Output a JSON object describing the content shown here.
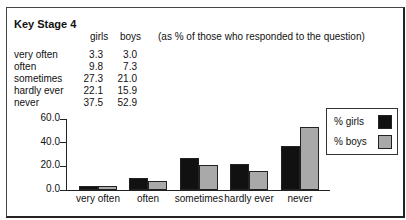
{
  "table": {
    "title": "Key Stage 4",
    "columns": [
      "girls",
      "boys"
    ],
    "note": "(as % of those who responded to the question)",
    "rows": [
      {
        "label": "very often",
        "girls": "3.3",
        "boys": "3.0"
      },
      {
        "label": "often",
        "girls": "9.8",
        "boys": "7.3"
      },
      {
        "label": "sometimes",
        "girls": "27.3",
        "boys": "21.0"
      },
      {
        "label": "hardly ever",
        "girls": "22.1",
        "boys": "15.9"
      },
      {
        "label": "never",
        "girls": "37.5",
        "boys": "52.9"
      }
    ]
  },
  "legend": {
    "girls": "% girls",
    "boys": "% boys"
  },
  "colors": {
    "girls": "#111111",
    "boys": "#a9a9a9"
  },
  "chart_data": {
    "type": "bar",
    "title": "Key Stage 4",
    "subtitle": "(as % of those who responded to the question)",
    "categories": [
      "very often",
      "often",
      "sometimes",
      "hardly ever",
      "never"
    ],
    "series": [
      {
        "name": "% girls",
        "values": [
          3.3,
          9.8,
          27.3,
          22.1,
          37.5
        ]
      },
      {
        "name": "% boys",
        "values": [
          3.0,
          7.3,
          21.0,
          15.9,
          52.9
        ]
      }
    ],
    "yticks": [
      "0.0",
      "20.0",
      "40.0",
      "60.0"
    ],
    "xlabel": "",
    "ylabel": "",
    "ylim": [
      0,
      60
    ],
    "grid": false,
    "legend_position": "right"
  }
}
